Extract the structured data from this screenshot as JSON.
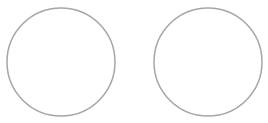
{
  "shapes": {
    "stroke_color": "#a6a6a6",
    "fill_color": "#ffffff",
    "items": [
      {
        "kind": "circle",
        "label": "left-circle"
      },
      {
        "kind": "circle",
        "label": "right-circle"
      }
    ]
  }
}
